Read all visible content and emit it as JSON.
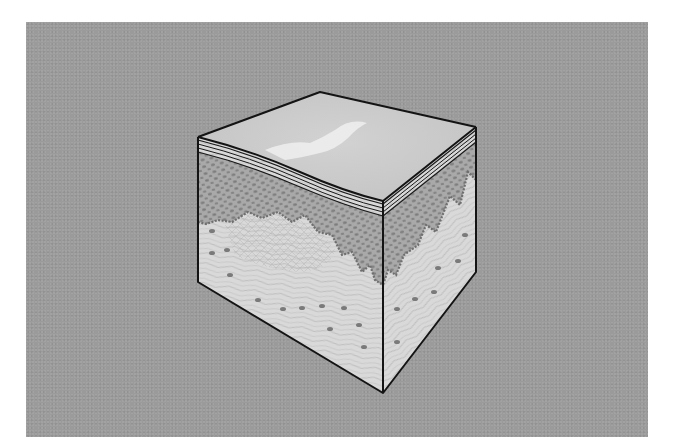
{
  "figure": {
    "colors": {
      "page_background": "#ffffff",
      "panel_background": "#9b9b9b",
      "top_surface": "#c9c9c9",
      "top_highlight": "#ececec",
      "stratum_bands": "#d4d4d4",
      "epidermis": "#a9a9a9",
      "epidermis_cells": "#7c7c7c",
      "dermis": "#d9d9d9",
      "dermis_fibers": "#b3b3b3",
      "dermis_cells": "#7a7a7a",
      "outline": "#141414"
    },
    "geometry": {
      "top_vertex": [
        320,
        92
      ],
      "left_top": [
        198,
        137
      ],
      "right_top": [
        476,
        127
      ],
      "front_top": [
        383,
        201
      ],
      "left_bottom": [
        198,
        282
      ],
      "right_bottom": [
        476,
        272
      ],
      "front_bottom": [
        383,
        393
      ]
    }
  }
}
